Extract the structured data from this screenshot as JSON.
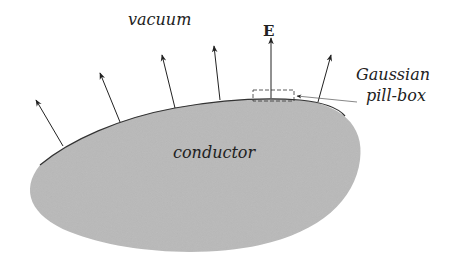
{
  "labels": {
    "vacuum": "vacuum",
    "field": "E",
    "pillbox_line1": "Gaussian",
    "pillbox_line2": "pill-box",
    "conductor": "conductor"
  },
  "colors": {
    "conductor_fill": "#b9b9b9",
    "outline": "#333333",
    "arrow": "#222222"
  }
}
